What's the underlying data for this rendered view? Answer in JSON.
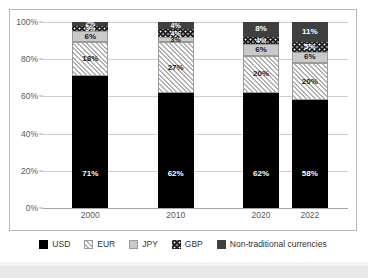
{
  "chart_data": {
    "type": "bar",
    "stacked": true,
    "stacked_mode": "percent",
    "title": "",
    "subtitle": "",
    "xlabel": "",
    "ylabel": "",
    "categories": [
      "2000",
      "2010",
      "2020",
      "2022"
    ],
    "ylim": [
      0,
      100
    ],
    "yticks": [
      0,
      20,
      40,
      60,
      80,
      100
    ],
    "ytick_labels": [
      "0%",
      "20%",
      "40%",
      "60%",
      "80%",
      "100%"
    ],
    "grid": true,
    "grid_axis": "y",
    "legend_position": "bottom",
    "series": [
      {
        "name": "USD",
        "color": "#000000",
        "pattern": "solid",
        "values": [
          71,
          62,
          62,
          58
        ],
        "labels": [
          "71%",
          "62%",
          "62%",
          "58%"
        ]
      },
      {
        "name": "EUR",
        "color": "#b0b0b0",
        "pattern": "diagonal-hatch",
        "values": [
          18,
          27,
          20,
          20
        ],
        "labels": [
          "18%",
          "27%",
          "20%",
          "20%"
        ]
      },
      {
        "name": "JPY",
        "color": "#c9c9c9",
        "pattern": "solid-light",
        "values": [
          6,
          3,
          6,
          6
        ],
        "labels": [
          "6%",
          "3%",
          "6%",
          "6%"
        ]
      },
      {
        "name": "GBP",
        "color": "#111111",
        "pattern": "dotted",
        "values": [
          3,
          4,
          4,
          5
        ],
        "labels": [
          "3%",
          "4%",
          "4%",
          "5%"
        ]
      },
      {
        "name": "Non-traditional currencies",
        "color": "#3f3f3f",
        "pattern": "solid-dark-gray",
        "values": [
          2,
          4,
          8,
          11
        ],
        "labels": [
          "2%",
          "4%",
          "8%",
          "11%"
        ]
      }
    ]
  },
  "legend": {
    "entries": [
      {
        "label": "USD",
        "swatch": "legend-swatch-usd"
      },
      {
        "label": "EUR",
        "swatch": "legend-swatch-eur"
      },
      {
        "label": "JPY",
        "swatch": "legend-swatch-jpy"
      },
      {
        "label": "GBP",
        "swatch": "legend-swatch-gbp"
      },
      {
        "label": "Non-traditional currencies",
        "swatch": "legend-swatch-ntc"
      }
    ]
  },
  "colors": {
    "usd": "#000000",
    "eur": "#b0b0b0",
    "jpy": "#c9c9c9",
    "gbp": "#111111",
    "non_traditional": "#3f3f3f",
    "gridline": "#cfcfcf",
    "axis": "#a6a6a6",
    "border": "#b9b9b9",
    "tick_text": "#595959"
  }
}
